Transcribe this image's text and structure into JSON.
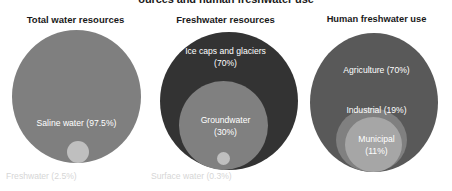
{
  "figure": {
    "title": "ources and human freshwater use",
    "bullet_icon": "bullet-square-icon"
  },
  "panels": [
    {
      "heading": "Total water resources",
      "bubbles": [
        {
          "label": "Saline water (97.5%)",
          "name": "saline water",
          "value": 97.5,
          "color": "#7f7f7f"
        },
        {
          "label": "Freshwater (2.5%)",
          "name": "Freshwater",
          "value": 2.5,
          "color": "#bfbfbf"
        }
      ]
    },
    {
      "heading": "Freshwater resources",
      "bubbles": [
        {
          "label": "Ice caps and glaciers (70%)",
          "name": "Ice caps and glaciers",
          "value": 70,
          "color": "#333333"
        },
        {
          "label": "Groundwater (30%)",
          "name": "Groundwater",
          "value": 30,
          "color": "#808080"
        },
        {
          "label": "Surface water (0.3%)",
          "name": "Surface water",
          "value": 0.3,
          "color": "#bfbfbf"
        }
      ]
    },
    {
      "heading": "Human freshwater use",
      "bubbles": [
        {
          "label": "Agriculture (70%)",
          "name": "Agriculture",
          "value": 70,
          "color": "#595959"
        },
        {
          "label": "Industrial (19%)",
          "name": "Industrial",
          "value": 19,
          "color": "#808080"
        },
        {
          "label": "Municipal (11%)",
          "name": "Municipal",
          "value": 11,
          "color": "#a6a6a6"
        }
      ]
    }
  ],
  "labels": {
    "saline": "Saline water (97.5%)",
    "freshwater": "Freshwater (2.5%)",
    "icecaps_line1": "Ice caps and glaciers",
    "icecaps_line2": "(70%)",
    "groundwater_line1": "Groundwater",
    "groundwater_line2": "(30%)",
    "surfacewater": "Surface water (0.3%)",
    "agriculture": "Agriculture (70%)",
    "industrial": "Industrial (19%)",
    "municipal_line1": "Municipal",
    "municipal_line2": "(11%)"
  },
  "chart_data": {
    "type": "pie",
    "xlabel": "",
    "ylabel": "",
    "note": "Three nested proportional-circle (Venn-style) diagrams showing percentage breakdowns.",
    "charts": [
      {
        "title": "Total water resources",
        "type": "pie",
        "categories": [
          "Saline water",
          "Freshwater"
        ],
        "values": [
          97.5,
          2.5
        ],
        "units": "percent"
      },
      {
        "title": "Freshwater resources",
        "type": "pie",
        "categories": [
          "Ice caps and glaciers",
          "Groundwater",
          "Surface water"
        ],
        "values": [
          70,
          30,
          0.3
        ],
        "units": "percent"
      },
      {
        "title": "Human freshwater use",
        "type": "pie",
        "categories": [
          "Agriculture",
          "Industrial",
          "Municipal"
        ],
        "values": [
          70,
          19,
          11
        ],
        "units": "percent"
      }
    ]
  }
}
